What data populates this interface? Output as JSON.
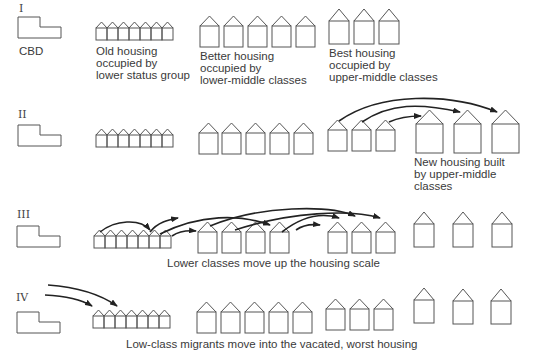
{
  "stages": [
    {
      "id": "I",
      "label": "I"
    },
    {
      "id": "II",
      "label": "II"
    },
    {
      "id": "III",
      "label": "III"
    },
    {
      "id": "IV",
      "label": "IV"
    }
  ],
  "labels": {
    "cbd": "CBD",
    "old_housing": "Old housing\noccupied by\nlower status group",
    "better_housing": "Better housing\noccupied by\nlower-middle classes",
    "best_housing": "Best housing\noccupied by\nupper-middle classes",
    "new_housing": "New housing built\nby upper-middle\nclasses",
    "stage3_caption": "Lower classes move up the housing scale",
    "stage4_caption": "Low-class migrants move into the vacated, worst housing"
  },
  "colors": {
    "stroke": "#555555",
    "arrow": "#222222",
    "text": "#3a3a3a"
  }
}
